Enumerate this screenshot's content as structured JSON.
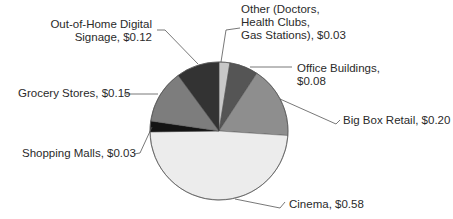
{
  "chart_data": {
    "type": "pie",
    "title": "",
    "value_format": "$",
    "start_angle_deg": -90,
    "direction": "clockwise",
    "center": [
      219,
      131
    ],
    "radius": 69,
    "slices": [
      {
        "name": "Other (Doctors, Health Clubs, Gas Stations)",
        "value": 0.03,
        "color": "#c8c8c8",
        "label_lines": [
          "Other (Doctors,",
          "Health Clubs,",
          "Gas Stations), $0.03"
        ],
        "label_pos": [
          241,
          3
        ],
        "align": "left",
        "leader": [
          [
            221,
            62
          ],
          [
            226,
            30
          ],
          [
            240,
            28
          ]
        ]
      },
      {
        "name": "Office Buildings",
        "value": 0.08,
        "color": "#555555",
        "label_lines": [
          "Office Buildings,",
          "$0.08"
        ],
        "label_pos": [
          297,
          62
        ],
        "align": "left",
        "leader": [
          [
            250,
            67
          ],
          [
            292,
            67
          ]
        ]
      },
      {
        "name": "Big Box Retail",
        "value": 0.2,
        "color": "#8e8e8e",
        "label_lines": [
          "Big Box Retail, $0.20"
        ],
        "label_pos": [
          343,
          114
        ],
        "align": "left",
        "leader": [
          [
            280,
            99
          ],
          [
            336,
            124
          ],
          [
            340,
            120
          ]
        ]
      },
      {
        "name": "Cinema",
        "value": 0.58,
        "color": "#ececec",
        "label_lines": [
          "Cinema, $0.58"
        ],
        "label_pos": [
          289,
          198
        ],
        "align": "left",
        "leader": [
          [
            235,
            199
          ],
          [
            280,
            208
          ],
          [
            285,
            202
          ]
        ]
      },
      {
        "name": "Shopping Malls",
        "value": 0.03,
        "color": "#141414",
        "label_lines": [
          "Shopping Malls, $0.03"
        ],
        "label_pos": [
          22,
          147
        ],
        "align": "left",
        "leader": [
          [
            152,
            127
          ],
          [
            140,
            153
          ],
          [
            134,
            154
          ]
        ]
      },
      {
        "name": "Grocery Stores",
        "value": 0.15,
        "color": "#7d7d7d",
        "label_lines": [
          "Grocery Stores, $0.15"
        ],
        "label_pos": [
          18,
          87
        ],
        "align": "left",
        "leader": [
          [
            124,
            94
          ],
          [
            158,
            94
          ]
        ]
      },
      {
        "name": "Out-of-Home Digital Signage",
        "value": 0.12,
        "color": "#333333",
        "label_lines": [
          "Out-of-Home Digital",
          "Signage, $0.12"
        ],
        "label_pos": [
          59,
          18
        ],
        "align": "right",
        "label_right": 152,
        "leader": [
          [
            157,
            30
          ],
          [
            165,
            30
          ],
          [
            198,
            64
          ]
        ]
      }
    ]
  }
}
